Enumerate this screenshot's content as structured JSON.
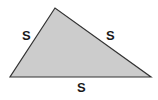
{
  "diagram": {
    "shape": "triangle",
    "type": "equilateral-sides-labeled",
    "vertices": [
      {
        "x": 55,
        "y": 8
      },
      {
        "x": 10,
        "y": 77
      },
      {
        "x": 151,
        "y": 77
      }
    ],
    "fill_color": "#cccccc",
    "stroke_color": "#333333",
    "labels": {
      "left_side": "S",
      "right_side": "S",
      "bottom_side": "S"
    }
  }
}
